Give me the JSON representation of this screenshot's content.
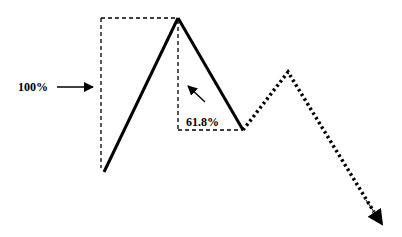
{
  "diagram": {
    "labels": {
      "full_move": "100%",
      "retracement": "61.8%"
    },
    "colors": {
      "line": "#000000",
      "background": "#ffffff"
    },
    "retracement_ratio": 0.618
  }
}
